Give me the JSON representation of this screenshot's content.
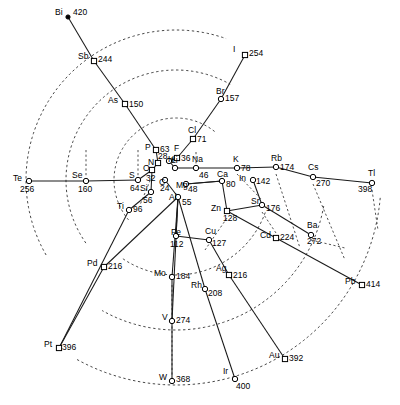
{
  "figure": {
    "type": "radial-scatter-network",
    "width": 400,
    "height": 405,
    "background_color": "#ffffff",
    "line_color": "#1a1a1a",
    "dash_color": "#333333",
    "marker_color": "#ffffff",
    "marker_stroke": "#000000"
  },
  "chart_data": {
    "type": "scatter",
    "title": "",
    "xlabel": "",
    "ylabel": "",
    "grid": "dashed-arcs",
    "legend": "none",
    "center": [
      176,
      180
    ],
    "label_format": "symbol value",
    "points": [
      {
        "symbol": "Bi",
        "value": 420,
        "x": 68,
        "y": 17,
        "marker": "dot",
        "sym_dx": -13,
        "sym_dy": -4,
        "val_dx": 5,
        "val_dy": -4
      },
      {
        "symbol": "I",
        "value": 254,
        "x": 245,
        "y": 55,
        "marker": "square",
        "sym_dx": -12,
        "sym_dy": -5,
        "val_dx": 4,
        "val_dy": -1
      },
      {
        "symbol": "Sb",
        "value": 244,
        "x": 94,
        "y": 61,
        "marker": "square",
        "sym_dx": -16,
        "sym_dy": -4,
        "val_dx": 4,
        "val_dy": -1
      },
      {
        "symbol": "Br",
        "value": 157,
        "x": 221,
        "y": 99,
        "marker": "circle",
        "sym_dx": -5,
        "sym_dy": -7,
        "val_dx": 4,
        "val_dy": 0
      },
      {
        "symbol": "As",
        "value": 150,
        "x": 125,
        "y": 104,
        "marker": "square",
        "sym_dx": -17,
        "sym_dy": -3,
        "val_dx": 4,
        "val_dy": 1
      },
      {
        "symbol": "Cl",
        "value": 71,
        "x": 193,
        "y": 139,
        "marker": "square",
        "sym_dx": -5,
        "sym_dy": -8,
        "val_dx": 4,
        "val_dy": 1
      },
      {
        "symbol": "P",
        "value": 63,
        "x": 156,
        "y": 150,
        "marker": "square",
        "sym_dx": -11,
        "sym_dy": -2,
        "val_dx": 4,
        "val_dy": 0
      },
      {
        "symbol": "F",
        "value": 36,
        "x": 177,
        "y": 158,
        "marker": "square",
        "sym_dx": -3,
        "sym_dy": -9,
        "val_dx": 4,
        "val_dy": 1
      },
      {
        "symbol": "N",
        "value": 28,
        "x": 158,
        "y": 163,
        "marker": "square",
        "sym_dx": -10,
        "sym_dy": 0,
        "val_dx": 0,
        "val_dy": -6
      },
      {
        "symbol": "H",
        "value": 0,
        "x": 169,
        "y": 161,
        "marker": "circle",
        "sym_dx": -1,
        "sym_dy": -1,
        "val_dx": 0,
        "val_dy": 0
      },
      {
        "symbol": "O",
        "value": 32,
        "x": 152,
        "y": 170,
        "marker": "square",
        "sym_dx": -9,
        "sym_dy": -1,
        "val_dx": -6,
        "val_dy": 9
      },
      {
        "symbol": "Li",
        "value": 0,
        "x": 175,
        "y": 168,
        "marker": "circle",
        "sym_dx": -4,
        "sym_dy": -7,
        "val_dx": 0,
        "val_dy": 0
      },
      {
        "symbol": "Na",
        "value": 46,
        "x": 196,
        "y": 168,
        "marker": "circle",
        "sym_dx": -4,
        "sym_dy": -8,
        "val_dx": 3,
        "val_dy": 8
      },
      {
        "symbol": "K",
        "value": 78,
        "x": 237,
        "y": 168,
        "marker": "circle",
        "sym_dx": -4,
        "sym_dy": -8,
        "val_dx": 4,
        "val_dy": 1
      },
      {
        "symbol": "Rb",
        "value": 174,
        "x": 276,
        "y": 167,
        "marker": "circle",
        "sym_dx": -5,
        "sym_dy": -8,
        "val_dx": 4,
        "val_dy": 1
      },
      {
        "symbol": "Cs",
        "value": 270,
        "x": 313,
        "y": 177,
        "marker": "circle",
        "sym_dx": -5,
        "sym_dy": -9,
        "val_dx": 3,
        "val_dy": 7
      },
      {
        "symbol": "Tl",
        "value": 398,
        "x": 372,
        "y": 183,
        "marker": "circle",
        "sym_dx": -4,
        "sym_dy": -9,
        "val_dx": -14,
        "val_dy": 7
      },
      {
        "symbol": "Te",
        "value": 256,
        "x": 29,
        "y": 181,
        "marker": "circle",
        "sym_dx": -16,
        "sym_dy": -2,
        "val_dx": -9,
        "val_dy": 9
      },
      {
        "symbol": "Se",
        "value": 160,
        "x": 86,
        "y": 181,
        "marker": "circle",
        "sym_dx": -14,
        "sym_dy": -5,
        "val_dx": -8,
        "val_dy": 9
      },
      {
        "symbol": "S",
        "value": 64,
        "x": 138,
        "y": 180,
        "marker": "circle",
        "sym_dx": -9,
        "sym_dy": -4,
        "val_dx": -8,
        "val_dy": 9
      },
      {
        "symbol": "C",
        "value": 24,
        "x": 165,
        "y": 180,
        "marker": "circle",
        "sym_dx": -6,
        "sym_dy": 3,
        "val_dx": -5,
        "val_dy": 9
      },
      {
        "symbol": "Mg",
        "value": 48,
        "x": 186,
        "y": 184,
        "marker": "circle",
        "sym_dx": -10,
        "sym_dy": 2,
        "val_dx": 2,
        "val_dy": 6
      },
      {
        "symbol": "Ca",
        "value": 80,
        "x": 222,
        "y": 181,
        "marker": "circle",
        "sym_dx": -5,
        "sym_dy": -6,
        "val_dx": 4,
        "val_dy": 4
      },
      {
        "symbol": "In",
        "value": 142,
        "x": 253,
        "y": 180,
        "marker": "circle",
        "sym_dx": -14,
        "sym_dy": -1,
        "val_dx": 3,
        "val_dy": 2
      },
      {
        "symbol": "Si",
        "value": 56,
        "x": 151,
        "y": 192,
        "marker": "circle",
        "sym_dx": -11,
        "sym_dy": -3,
        "val_dx": -8,
        "val_dy": 9
      },
      {
        "symbol": "Al",
        "value": 55,
        "x": 178,
        "y": 197,
        "marker": "circle",
        "sym_dx": -9,
        "sym_dy": 1,
        "val_dx": 4,
        "val_dy": 6
      },
      {
        "symbol": "Sr",
        "value": 176,
        "x": 262,
        "y": 205,
        "marker": "circle",
        "sym_dx": -11,
        "sym_dy": -3,
        "val_dx": 4,
        "val_dy": 4
      },
      {
        "symbol": "Zn",
        "value": 128,
        "x": 227,
        "y": 211,
        "marker": "square",
        "sym_dx": -16,
        "sym_dy": -2,
        "val_dx": -4,
        "val_dy": 8
      },
      {
        "symbol": "Ti",
        "value": 96,
        "x": 129,
        "y": 210,
        "marker": "circle",
        "sym_dx": -12,
        "sym_dy": -3,
        "val_dx": 4,
        "val_dy": 0
      },
      {
        "symbol": "Cd",
        "value": 224,
        "x": 276,
        "y": 238,
        "marker": "square",
        "sym_dx": -16,
        "sym_dy": -2,
        "val_dx": 4,
        "val_dy": 0
      },
      {
        "symbol": "Ba",
        "value": 272,
        "x": 311,
        "y": 235,
        "marker": "circle",
        "sym_dx": -4,
        "sym_dy": -9,
        "val_dx": -4,
        "val_dy": 7
      },
      {
        "symbol": "Cu",
        "value": 127,
        "x": 209,
        "y": 240,
        "marker": "circle",
        "sym_dx": -4,
        "sym_dy": -8,
        "val_dx": 3,
        "val_dy": 4
      },
      {
        "symbol": "Fe",
        "value": 112,
        "x": 176,
        "y": 236,
        "marker": "circle",
        "sym_dx": -5,
        "sym_dy": -3,
        "val_dx": -6,
        "val_dy": 9
      },
      {
        "symbol": "Pd",
        "value": 216,
        "x": 104,
        "y": 267,
        "marker": "square",
        "sym_dx": -17,
        "sym_dy": -3,
        "val_dx": 4,
        "val_dy": 0
      },
      {
        "symbol": "Mo",
        "value": 184,
        "x": 172,
        "y": 277,
        "marker": "circle",
        "sym_dx": -18,
        "sym_dy": -3,
        "val_dx": 4,
        "val_dy": 0
      },
      {
        "symbol": "Ag",
        "value": 216,
        "x": 229,
        "y": 275,
        "marker": "square",
        "sym_dx": -13,
        "sym_dy": -6,
        "val_dx": 4,
        "val_dy": 1
      },
      {
        "symbol": "Rh",
        "value": 208,
        "x": 205,
        "y": 289,
        "marker": "circle",
        "sym_dx": -14,
        "sym_dy": -3,
        "val_dx": 3,
        "val_dy": 5
      },
      {
        "symbol": "Pb",
        "value": 414,
        "x": 362,
        "y": 285,
        "marker": "square",
        "sym_dx": -17,
        "sym_dy": -3,
        "val_dx": 4,
        "val_dy": 0
      },
      {
        "symbol": "V",
        "value": 274,
        "x": 172,
        "y": 321,
        "marker": "circle",
        "sym_dx": -10,
        "sym_dy": -3,
        "val_dx": 4,
        "val_dy": 0
      },
      {
        "symbol": "Pt",
        "value": 396,
        "x": 59,
        "y": 348,
        "marker": "square",
        "sym_dx": -15,
        "sym_dy": -3,
        "val_dx": 3,
        "val_dy": 0
      },
      {
        "symbol": "Au",
        "value": 392,
        "x": 285,
        "y": 359,
        "marker": "square",
        "sym_dx": -16,
        "sym_dy": -3,
        "val_dx": 4,
        "val_dy": 0
      },
      {
        "symbol": "W",
        "value": 368,
        "x": 172,
        "y": 381,
        "marker": "circle",
        "sym_dx": -13,
        "sym_dy": -3,
        "val_dx": 4,
        "val_dy": -1
      },
      {
        "symbol": "Ir",
        "value": 400,
        "x": 235,
        "y": 379,
        "marker": "circle",
        "sym_dx": -12,
        "sym_dy": -7,
        "val_dx": 1,
        "val_dy": 8
      }
    ],
    "edges": [
      [
        "Bi",
        "Sb"
      ],
      [
        "Sb",
        "As"
      ],
      [
        "As",
        "P"
      ],
      [
        "P",
        "N"
      ],
      [
        "I",
        "Br"
      ],
      [
        "Br",
        "Cl"
      ],
      [
        "Cl",
        "F"
      ],
      [
        "Te",
        "Se"
      ],
      [
        "Se",
        "S"
      ],
      [
        "S",
        "O"
      ],
      [
        "Li",
        "Na"
      ],
      [
        "Na",
        "K"
      ],
      [
        "K",
        "Rb"
      ],
      [
        "Rb",
        "Cs"
      ],
      [
        "Cs",
        "Tl"
      ],
      [
        "Mg",
        "Ca"
      ],
      [
        "Ca",
        "Zn"
      ],
      [
        "Zn",
        "Cd"
      ],
      [
        "Cd",
        "Pb"
      ],
      [
        "Si",
        "Ti"
      ],
      [
        "Ti",
        "Pt"
      ],
      [
        "Al",
        "Fe"
      ],
      [
        "Al",
        "Mo"
      ],
      [
        "Al",
        "Pd"
      ],
      [
        "Al",
        "V"
      ],
      [
        "Al",
        "Rh"
      ],
      [
        "Fe",
        "Cu"
      ],
      [
        "Cu",
        "Ag"
      ],
      [
        "Ag",
        "Au"
      ],
      [
        "Mo",
        "W"
      ],
      [
        "Rh",
        "Ir"
      ],
      [
        "Pd",
        "Pt"
      ],
      [
        "C",
        "Al"
      ],
      [
        "O",
        "Si"
      ],
      [
        "H",
        "Li"
      ],
      [
        "N",
        "O"
      ],
      [
        "F",
        "H"
      ],
      [
        "Sr",
        "Ba"
      ],
      [
        "In",
        "Sr"
      ],
      [
        "Ca",
        "Mg"
      ],
      [
        "Zn",
        "Sr"
      ]
    ],
    "arcs": [
      {
        "r": 150,
        "start_deg": 150,
        "end_deg": 290,
        "note": "outer dashed arc upper-left"
      },
      {
        "r": 110,
        "start_deg": 145,
        "end_deg": 300,
        "note": "middle dashed arc"
      },
      {
        "r": 62,
        "start_deg": 140,
        "end_deg": 310,
        "note": "inner dashed arc"
      },
      {
        "r": 205,
        "start_deg": 5,
        "end_deg": 120,
        "note": "outer dashed arc lower-right"
      },
      {
        "r": 150,
        "start_deg": 10,
        "end_deg": 120,
        "note": "middle dashed arc lower-right"
      },
      {
        "r": 95,
        "start_deg": 20,
        "end_deg": 125,
        "note": "inner dashed arc lower-right"
      }
    ]
  }
}
